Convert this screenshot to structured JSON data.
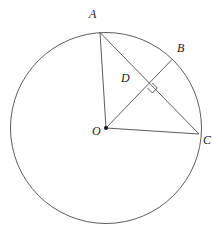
{
  "figure": {
    "background_color": "#ffffff",
    "stroke_color": "#4a4a4a",
    "label_color": "#1a1a1a",
    "stroke_width": 0.9
  },
  "geometry": {
    "circle": {
      "center": {
        "x": 106,
        "y": 128
      },
      "radius": 95.5
    },
    "points": [
      {
        "name": "A",
        "x": 100,
        "y": 32.5,
        "on_circle": true,
        "marker": "none"
      },
      {
        "name": "B",
        "x": 172,
        "y": 59.5,
        "on_circle": true,
        "marker": "none"
      },
      {
        "name": "C",
        "x": 199,
        "y": 134,
        "on_circle": true,
        "marker": "none"
      },
      {
        "name": "D",
        "x": 147.5,
        "y": 88,
        "on_circle": false,
        "marker": "none"
      },
      {
        "name": "O",
        "x": 106,
        "y": 128,
        "on_circle": false,
        "marker": "dot"
      }
    ],
    "segments": [
      {
        "name": "OA",
        "from": "O",
        "to": "A"
      },
      {
        "name": "AC",
        "from": "A",
        "to": "C"
      },
      {
        "name": "OB",
        "from": "O",
        "to": "B"
      },
      {
        "name": "OC",
        "from": "O",
        "to": "C"
      }
    ],
    "right_angle": {
      "at": "D",
      "size": 7,
      "marker": "square"
    }
  },
  "labels": {
    "A": {
      "text": "A",
      "x": 89,
      "y": 8,
      "font_size": 12
    },
    "B": {
      "text": "B",
      "x": 177,
      "y": 42,
      "font_size": 12
    },
    "C": {
      "text": "C",
      "x": 203,
      "y": 134,
      "font_size": 12
    },
    "D": {
      "text": "D",
      "x": 121,
      "y": 72,
      "font_size": 12
    },
    "O": {
      "text": "O",
      "x": 92,
      "y": 125,
      "font_size": 12
    }
  }
}
